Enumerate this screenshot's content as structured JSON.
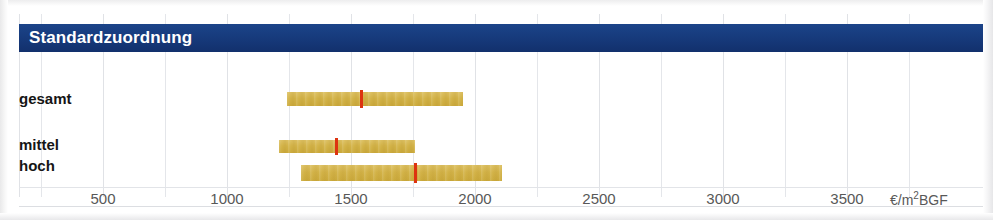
{
  "header": {
    "title": "Standardzuordnung",
    "background_color": "#16397a",
    "text_color": "#ffffff"
  },
  "colors": {
    "bar": "#d3b348",
    "marker": "#dd3310",
    "gridline": "#e4e6ea",
    "tick_text": "#585858",
    "label_text": "#151515"
  },
  "chart_data": {
    "type": "bar",
    "orientation": "horizontal",
    "title": "Standardzuordnung",
    "xlabel": "€/m² BGF",
    "ylabel": "",
    "xlim": [
      0,
      3800
    ],
    "grid": true,
    "legend": null,
    "unit_label": "€/m²BGF",
    "unit_prefix": "€/m",
    "unit_superscript": "2",
    "unit_suffix": "BGF",
    "xticks": [
      500,
      1000,
      1500,
      2000,
      2500,
      3000,
      3500
    ],
    "xticklabels": [
      "500",
      "1000",
      "1500",
      "2000",
      "2500",
      "3000",
      "3500"
    ],
    "categories": [
      "gesamt",
      "mittel",
      "hoch"
    ],
    "series": [
      {
        "name": "gesamt",
        "label": "gesamt",
        "low": 1240,
        "high": 1950,
        "marker": 1540
      },
      {
        "name": "mittel",
        "label": "mittel",
        "low": 1210,
        "high": 1760,
        "marker": 1440
      },
      {
        "name": "hoch",
        "label": "hoch",
        "low": 1300,
        "high": 2110,
        "marker": 1760
      }
    ]
  }
}
